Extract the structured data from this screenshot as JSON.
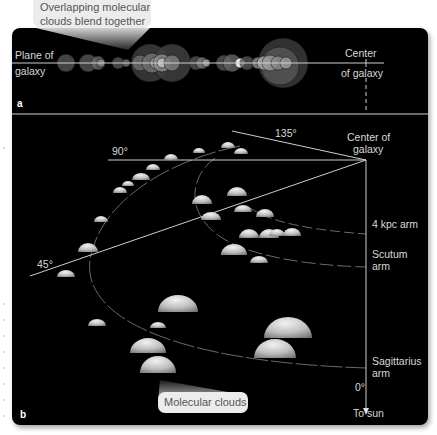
{
  "callouts": {
    "top": {
      "line1": "Overlapping molecular",
      "line2": "clouds blend together"
    },
    "bottom": {
      "text": "Molecular clouds"
    }
  },
  "panel_a": {
    "letter": "a",
    "plane_label": {
      "line1": "Plane of",
      "line2": "galaxy"
    },
    "center_label": {
      "line1": "Center",
      "line2": "of galaxy"
    }
  },
  "panel_b": {
    "letter": "b",
    "center_label": {
      "line1": "Center of",
      "line2": "galaxy"
    },
    "angles": {
      "a0": "0°",
      "a45": "45°",
      "a90": "90°",
      "a135": "135°"
    },
    "arms": {
      "kpc4": "4 kpc arm",
      "scutum": {
        "line1": "Scutum",
        "line2": "arm"
      },
      "sagittarius": {
        "line1": "Sagittarius",
        "line2": "arm"
      }
    },
    "to_sun": "To sun"
  },
  "colors": {
    "panel_bg": "#000000",
    "line": "#cfcfcf",
    "callout_bg": "#ececec",
    "cloud_light": "#e6e6e6",
    "cloud_dark": "#6a6a6a"
  }
}
